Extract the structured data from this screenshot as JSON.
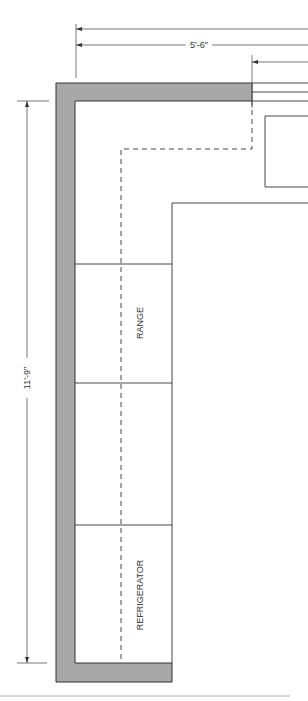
{
  "diagram": {
    "dimensions": {
      "horizontal_overall": "",
      "horizontal_wall": "5'-6\"",
      "vertical_wall": "11'-9\""
    },
    "appliances": [
      {
        "label": "RANGE"
      },
      {
        "label": "REFRIGERATOR"
      }
    ],
    "colors": {
      "wall_fill": "#a8a8a8",
      "line": "#333333",
      "rule": "#b0b0b0"
    }
  }
}
